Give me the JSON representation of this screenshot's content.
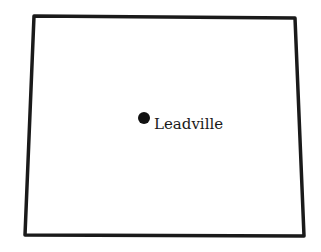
{
  "map": {
    "region": "state-outline",
    "outline_color": "#1a1a1a",
    "outline_points": [
      [
        34,
        16
      ],
      [
        295,
        18
      ],
      [
        304,
        236
      ],
      [
        25,
        235
      ]
    ],
    "cities": [
      {
        "name": "Leadville",
        "marker": "filled-circle",
        "x": 144,
        "y": 118,
        "label_x": 154,
        "label_y": 129
      }
    ]
  }
}
